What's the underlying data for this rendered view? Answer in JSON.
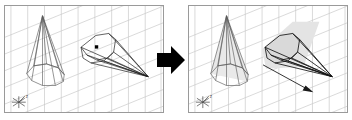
{
  "figure": {
    "panel_count": 2
  },
  "transition": {
    "icon": "right-arrow-icon",
    "label": "transforms to",
    "color": "#000000"
  },
  "panels": [
    {
      "id": "before",
      "label": "Before",
      "grid": {
        "visible": true,
        "color": "#c8c8c8",
        "vertical_lines": 9,
        "diagonal_lines": 7,
        "style": "perspective-grid"
      },
      "objects": [
        {
          "name": "tall-cone",
          "type": "wireframe-cone",
          "facets": 9,
          "shaded": false,
          "fill": "none",
          "stroke": "#555555"
        },
        {
          "name": "lying-cone",
          "type": "wireframe-cone",
          "facets": 9,
          "shaded": false,
          "fill": "none",
          "stroke": "#222222",
          "marker": {
            "name": "center-point-marker",
            "shape": "square",
            "color": "#000000"
          }
        }
      ],
      "axis_indicator": {
        "name": "axis-compass-icon",
        "label": "z",
        "color": "#444444",
        "spokes": 6
      },
      "arrow": null
    },
    {
      "id": "after",
      "label": "After",
      "grid": {
        "visible": true,
        "color": "#c8c8c8",
        "vertical_lines": 9,
        "diagonal_lines": 7,
        "style": "perspective-grid"
      },
      "objects": [
        {
          "name": "tall-cone",
          "type": "wireframe-cone",
          "facets": 9,
          "shaded": true,
          "fill": "#e8e8e8",
          "stroke": "#555555"
        },
        {
          "name": "lying-cone",
          "type": "wireframe-cone",
          "facets": 9,
          "shaded": true,
          "fill": "#d8d8d8",
          "stroke": "#111111",
          "marker": null
        }
      ],
      "axis_indicator": {
        "name": "axis-compass-icon",
        "label": "z",
        "color": "#444444",
        "spokes": 6
      },
      "arrow": {
        "name": "direction-arrow",
        "color": "#1a1a1a",
        "label": "drag direction"
      }
    }
  ],
  "colors": {
    "border": "#9a9a9a",
    "grid": "#c8c8c8",
    "wire": "#333333",
    "shade": "#d8d8d8",
    "background": "#ffffff"
  }
}
